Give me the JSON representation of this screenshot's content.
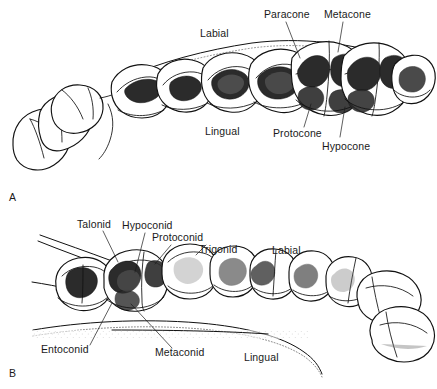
{
  "figure": {
    "caption_letters": {
      "panel_a": "A",
      "panel_b": "B"
    },
    "panels": [
      {
        "id": "panel-a",
        "letter": "A",
        "description": "Upper dentition, occlusal view",
        "labels": [
          {
            "name": "paracone",
            "text": "Paracone",
            "x": 264,
            "y": 18
          },
          {
            "name": "metacone",
            "text": "Metacone",
            "x": 324,
            "y": 18
          },
          {
            "name": "labial",
            "text": "Labial",
            "x": 200,
            "y": 37
          },
          {
            "name": "lingual",
            "text": "Lingual",
            "x": 205,
            "y": 135
          },
          {
            "name": "protocone",
            "text": "Protocone",
            "x": 273,
            "y": 137
          },
          {
            "name": "hypocone",
            "text": "Hypocone",
            "x": 322,
            "y": 150
          }
        ]
      },
      {
        "id": "panel-b",
        "letter": "B",
        "description": "Lower dentition, occlusal view",
        "labels": [
          {
            "name": "talonid",
            "text": "Talonid",
            "x": 77,
            "y": 228
          },
          {
            "name": "hypoconid",
            "text": "Hypoconid",
            "x": 122,
            "y": 229
          },
          {
            "name": "protoconid",
            "text": "Protoconid",
            "x": 152,
            "y": 241
          },
          {
            "name": "trigonid",
            "text": "Trigonid",
            "x": 199,
            "y": 253
          },
          {
            "name": "labial",
            "text": "Labial",
            "x": 272,
            "y": 254
          },
          {
            "name": "entoconid",
            "text": "Entoconid",
            "x": 41,
            "y": 353
          },
          {
            "name": "metaconid",
            "text": "Metaconid",
            "x": 155,
            "y": 356
          },
          {
            "name": "lingual",
            "text": "Lingual",
            "x": 244,
            "y": 361
          }
        ]
      }
    ],
    "colors": {
      "background": "#ffffff",
      "ink": "#111111",
      "label_text": "#1a1a1a",
      "wear_facet": "#2b2b2b",
      "stipple": "#555555"
    }
  }
}
